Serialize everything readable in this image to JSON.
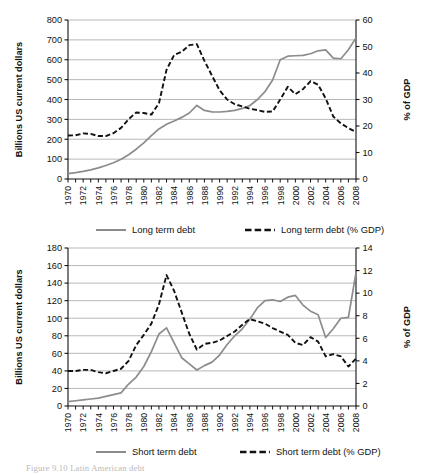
{
  "figure": {
    "caption": "Figure 9.10 Latin American debt",
    "panels": [
      "top",
      "bottom"
    ]
  },
  "colors": {
    "solid_series": "#8c8c8c",
    "dashed_series": "#111111",
    "grid": "#9a9a9a",
    "axis": "#111111",
    "background": "#ffffff"
  },
  "chart_data": [
    {
      "type": "line",
      "id": "long-term-debt",
      "title": "",
      "xlabel": "",
      "ylabel": "Billions US current dollars",
      "y2label": "% of GDP",
      "ylim": [
        0,
        800
      ],
      "y2lim": [
        0,
        60
      ],
      "yticks": [
        0,
        100,
        200,
        300,
        400,
        500,
        600,
        700,
        800
      ],
      "y2ticks": [
        0,
        10,
        20,
        30,
        40,
        50,
        60
      ],
      "xlim": [
        1970,
        2008
      ],
      "xticks": [
        1970,
        1972,
        1974,
        1976,
        1978,
        1980,
        1982,
        1984,
        1986,
        1988,
        1990,
        1992,
        1994,
        1996,
        1998,
        2000,
        2002,
        2004,
        2006,
        2008
      ],
      "x": [
        1970,
        1971,
        1972,
        1973,
        1974,
        1975,
        1976,
        1977,
        1978,
        1979,
        1980,
        1981,
        1982,
        1983,
        1984,
        1985,
        1986,
        1987,
        1988,
        1989,
        1990,
        1991,
        1992,
        1993,
        1994,
        1995,
        1996,
        1997,
        1998,
        1999,
        2000,
        2001,
        2002,
        2003,
        2004,
        2005,
        2006,
        2007,
        2008
      ],
      "grid": true,
      "legend_position": "bottom",
      "series": [
        {
          "name": "Long term debt",
          "style": "solid",
          "axis": "left",
          "units": "Billions US current dollars",
          "values": [
            27,
            32,
            38,
            46,
            56,
            68,
            82,
            99,
            122,
            150,
            182,
            218,
            252,
            275,
            292,
            310,
            332,
            370,
            345,
            338,
            337,
            340,
            345,
            355,
            370,
            400,
            440,
            498,
            600,
            618,
            620,
            622,
            630,
            645,
            650,
            608,
            605,
            650,
            710
          ]
        },
        {
          "name": "Long term debt (% GDP)",
          "style": "dashed",
          "axis": "right",
          "units": "% of GDP",
          "values": [
            16.4,
            16.5,
            17.2,
            17.0,
            16.2,
            16.2,
            17.3,
            19.3,
            22.6,
            25.1,
            24.9,
            24.3,
            28.6,
            41.2,
            46.8,
            48.0,
            50.5,
            50.9,
            44.6,
            39.0,
            33.5,
            30.0,
            28.2,
            27.4,
            26.5,
            26.0,
            25.3,
            25.5,
            30.0,
            34.8,
            32.0,
            33.9,
            36.9,
            35.6,
            30.4,
            23.6,
            21.0,
            19.2,
            17.7
          ]
        }
      ]
    },
    {
      "type": "line",
      "id": "short-term-debt",
      "title": "",
      "xlabel": "",
      "ylabel": "Billions US current dollars",
      "y2label": "% of GDP",
      "ylim": [
        0,
        180
      ],
      "y2lim": [
        0,
        14
      ],
      "yticks": [
        0,
        20,
        40,
        60,
        80,
        100,
        120,
        140,
        160,
        180
      ],
      "y2ticks": [
        0,
        2,
        4,
        6,
        8,
        10,
        12,
        14
      ],
      "xlim": [
        1970,
        2008
      ],
      "xticks": [
        1970,
        1972,
        1974,
        1976,
        1978,
        1980,
        1982,
        1984,
        1986,
        1988,
        1990,
        1992,
        1994,
        1996,
        1998,
        2000,
        2002,
        2004,
        2006,
        2008
      ],
      "x": [
        1970,
        1971,
        1972,
        1973,
        1974,
        1975,
        1976,
        1977,
        1978,
        1979,
        1980,
        1981,
        1982,
        1983,
        1984,
        1985,
        1986,
        1987,
        1988,
        1989,
        1990,
        1991,
        1992,
        1993,
        1994,
        1995,
        1996,
        1997,
        1998,
        1999,
        2000,
        2001,
        2002,
        2003,
        2004,
        2005,
        2006,
        2007,
        2008
      ],
      "grid": true,
      "legend_position": "bottom",
      "series": [
        {
          "name": "Short term debt",
          "style": "solid",
          "axis": "left",
          "units": "Billions US current dollars",
          "values": [
            5,
            6,
            7,
            8,
            9,
            11,
            13,
            15,
            25,
            33,
            45,
            62,
            82,
            89,
            72,
            55,
            48,
            41,
            46,
            50,
            58,
            70,
            80,
            88,
            99,
            112,
            120,
            121,
            119,
            124,
            126,
            115,
            108,
            104,
            78,
            88,
            100,
            101,
            152
          ]
        },
        {
          "name": "Short term debt (% GDP)",
          "style": "dashed",
          "axis": "right",
          "units": "% of GDP",
          "values": [
            3.1,
            3.1,
            3.2,
            3.2,
            3.0,
            2.9,
            3.1,
            3.3,
            4.0,
            5.4,
            6.3,
            7.3,
            9.0,
            11.6,
            10.2,
            8.3,
            6.4,
            5.0,
            5.5,
            5.6,
            5.8,
            6.2,
            6.6,
            7.2,
            7.7,
            7.5,
            7.3,
            6.9,
            6.6,
            6.3,
            5.6,
            5.4,
            6.1,
            5.7,
            4.4,
            4.6,
            4.4,
            3.5,
            4.2
          ]
        }
      ]
    }
  ],
  "top_chart": {
    "ylabel": "Billions US current dollars",
    "y2label": "% of GDP",
    "yticks": [
      "800",
      "700",
      "600",
      "500",
      "400",
      "300",
      "200",
      "100",
      "0"
    ],
    "y2ticks": [
      "60",
      "50",
      "40",
      "30",
      "20",
      "10",
      "0"
    ],
    "xticks": [
      "1970",
      "1972",
      "1974",
      "1976",
      "1978",
      "1980",
      "1982",
      "1984",
      "1986",
      "1988",
      "1990",
      "1992",
      "1994",
      "1996",
      "1998",
      "2000",
      "2002",
      "2004",
      "2006",
      "2008"
    ],
    "legend": [
      {
        "label": "Long term debt",
        "style": "solid"
      },
      {
        "label": "Long term debt (% GDP)",
        "style": "dashed"
      }
    ]
  },
  "bottom_chart": {
    "ylabel": "Billions US current dollars",
    "y2label": "% of GDP",
    "yticks": [
      "180",
      "160",
      "140",
      "120",
      "100",
      "80",
      "60",
      "40",
      "20",
      "0"
    ],
    "y2ticks": [
      "14",
      "12",
      "10",
      "8",
      "6",
      "4",
      "2",
      "0"
    ],
    "xticks": [
      "1970",
      "1972",
      "1974",
      "1976",
      "1978",
      "1980",
      "1982",
      "1984",
      "1986",
      "1988",
      "1990",
      "1992",
      "1994",
      "1996",
      "1998",
      "2000",
      "2002",
      "2004",
      "2006",
      "2008"
    ],
    "legend": [
      {
        "label": "Short term debt",
        "style": "solid"
      },
      {
        "label": "Short term debt (% GDP)",
        "style": "dashed"
      }
    ]
  }
}
